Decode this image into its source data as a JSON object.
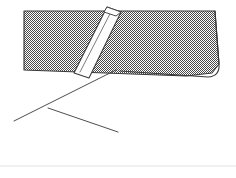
{
  "figure": {
    "canvas": {
      "width": 236,
      "height": 178,
      "background": "#ffffff"
    },
    "colors": {
      "hatch_fill_light": "#ffffff",
      "hatch_fill_dark": "#4a4a4a",
      "hatch_apparent_gray": "#9a9a9a",
      "stroke": "#3a3a3a",
      "bar_fill": "#fdfdfd",
      "bar_stroke": "#3a3a3a",
      "baseline_rule": "#e2e2e2"
    },
    "stroke_widths": {
      "outline": 1.1,
      "thin_line": 0.9,
      "baseline": 1
    },
    "regions": [
      {
        "name": "hatched-sheet-top-face",
        "fill": "checkerboard-hatch",
        "points": "24,11 215,11 219,66 204,74 24,70"
      }
    ],
    "paths": [
      {
        "name": "fold-curve-right-edge",
        "description": "rounded fold at right side of sheet",
        "d": "M 215,11 L 219,64 Q 220,76 208,77 L 120,71"
      },
      {
        "name": "fold-underside-curve",
        "description": "lower lip of the fold sweeping left",
        "d": "M 214,78 Q 203,79 190,85 L 48,156"
      },
      {
        "name": "crease-line-upper",
        "description": "crease running down-left from sheet bottom edge",
        "d": "M 116,70 L 14,121"
      },
      {
        "name": "chevron-line-left",
        "description": "short segment of the interior chevron",
        "d": "M 48,108 L 118,132"
      },
      {
        "name": "baseline-rule",
        "description": "faint horizontal rule near bottom of frame",
        "d": "M 0,166 L 236,166"
      }
    ],
    "bar": {
      "name": "diagonal-bar",
      "description": "slender white 3D bar crossing the hatched sheet",
      "body_points": "74,73 107,7 121,12 89,78",
      "highlight_line": {
        "x1": 80,
        "y1": 72,
        "x2": 112,
        "y2": 10
      },
      "cap_top_points": "107,7 121,12 116,16 104,12",
      "angle_degrees": -63
    }
  }
}
